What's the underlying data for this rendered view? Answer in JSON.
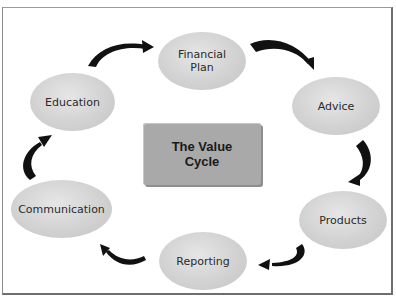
{
  "diagram": {
    "title_line1": "The Value",
    "title_line2": "Cycle",
    "nodes": [
      {
        "id": "financial-plan",
        "line1": "Financial",
        "line2": "Plan"
      },
      {
        "id": "advice",
        "line1": "Advice"
      },
      {
        "id": "products",
        "line1": "Products"
      },
      {
        "id": "reporting",
        "line1": "Reporting"
      },
      {
        "id": "communication",
        "line1": "Communication"
      },
      {
        "id": "education",
        "line1": "Education"
      }
    ],
    "flow": [
      "Financial Plan",
      "Advice",
      "Products",
      "Reporting",
      "Communication",
      "Education",
      "Financial Plan"
    ],
    "colors": {
      "node_fill": "#d2d2d2",
      "center_fill": "#a9a9a9",
      "arrow": "#111111"
    }
  }
}
